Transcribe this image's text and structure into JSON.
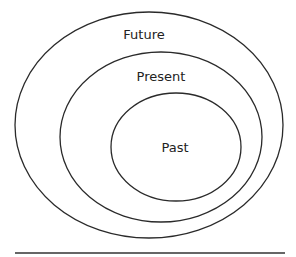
{
  "diagram": {
    "type": "nested-ellipses",
    "rings": [
      {
        "label": "Future",
        "cx": 149,
        "cy": 125,
        "rx": 134,
        "ry": 113,
        "label_x": 144,
        "label_y": 39
      },
      {
        "label": "Present",
        "cx": 161,
        "cy": 137,
        "rx": 101,
        "ry": 85,
        "label_x": 161,
        "label_y": 81
      },
      {
        "label": "Past",
        "cx": 176,
        "cy": 147,
        "rx": 65,
        "ry": 54,
        "label_x": 175,
        "label_y": 152
      }
    ],
    "baseline": {
      "x1": 15,
      "x2": 285,
      "y": 253
    },
    "stroke_color": "#2a2a2a",
    "baseline_color": "#666666"
  }
}
